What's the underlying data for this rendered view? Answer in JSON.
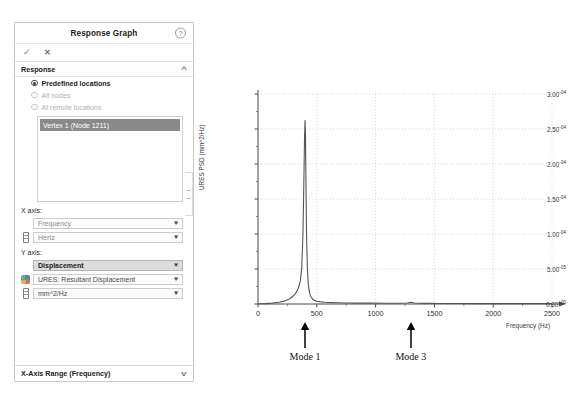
{
  "panel": {
    "title": "Response Graph",
    "help_icon": "?",
    "accept_icon": "check-icon",
    "cancel_icon": "close-icon",
    "sections": [
      {
        "title": "Response",
        "chevron": "^"
      }
    ],
    "radios": [
      {
        "label": "Predefined locations",
        "selected": true,
        "enabled": true
      },
      {
        "label": "All nodes",
        "selected": false,
        "enabled": false
      },
      {
        "label": "At remote locations",
        "selected": false,
        "enabled": false
      }
    ],
    "location_list": {
      "selected_item": "Vertex 1 (Node 1211)"
    },
    "x_axis": {
      "label": "X axis:",
      "quantity": "Frequency",
      "unit": "Hertz"
    },
    "y_axis": {
      "label": "Y axis:",
      "quantity": "Displacement",
      "component": "URES:   Resultant Displacement",
      "unit": "mm^2/Hz"
    },
    "bottom_section": {
      "title": "X-Axis Range  (Frequency)",
      "chevron": "v"
    }
  },
  "chart_data": {
    "type": "line",
    "title": "",
    "xlabel": "Frequency (Hz)",
    "ylabel": "URES PSD (mm^2/Hz)",
    "xlim": [
      0,
      2500
    ],
    "ylim": [
      0,
      0.0003
    ],
    "grid": true,
    "legend": null,
    "xticks": [
      0,
      500,
      1000,
      1500,
      2000,
      2500
    ],
    "xtick_labels": [
      "0",
      "500",
      "1000",
      "1500",
      "2000",
      "2500"
    ],
    "yticks": [
      0,
      5e-05,
      0.0001,
      0.00015,
      0.0002,
      0.00025,
      0.0003
    ],
    "ytick_labels": [
      {
        "mantissa": "0.00",
        "exponent": "+00"
      },
      {
        "mantissa": "5.00",
        "exponent": "-05"
      },
      {
        "mantissa": "1.00",
        "exponent": "-04"
      },
      {
        "mantissa": "1.50",
        "exponent": "-04"
      },
      {
        "mantissa": "2.00",
        "exponent": "-04"
      },
      {
        "mantissa": "2.50",
        "exponent": "-04"
      },
      {
        "mantissa": "3.00",
        "exponent": "-04"
      }
    ],
    "series": [
      {
        "name": "URES PSD",
        "color": "#555555",
        "x": [
          0,
          60,
          120,
          180,
          230,
          270,
          300,
          325,
          345,
          360,
          372,
          382,
          390,
          396,
          400,
          404,
          408,
          413,
          420,
          428,
          437,
          448,
          462,
          480,
          500,
          530,
          570,
          620,
          680,
          750,
          840,
          950,
          1080,
          1200,
          1270,
          1300,
          1330,
          1380,
          1450,
          1550,
          1700,
          1850,
          2000,
          2200,
          2400,
          2500
        ],
        "y": [
          4e-07,
          6e-07,
          1.2e-06,
          2.5e-06,
          4.5e-06,
          7.5e-06,
          1.15e-05,
          1.65e-05,
          2.35e-05,
          3.3e-05,
          5.2e-05,
          9.8e-05,
          0.000175,
          0.00024,
          0.000262,
          0.000238,
          0.00017,
          9.8e-05,
          5e-05,
          2.8e-05,
          1.7e-05,
          1.1e-05,
          7.5e-06,
          5.2e-06,
          4e-06,
          3e-06,
          2.4e-06,
          2e-06,
          1.7e-06,
          1.5e-06,
          1.3e-06,
          1.2e-06,
          1.1e-06,
          1.1e-06,
          1.4e-06,
          2.6e-06,
          1.5e-06,
          1.1e-06,
          9e-07,
          8e-07,
          7e-07,
          6e-07,
          6e-07,
          5e-07,
          5e-07,
          5e-07
        ]
      }
    ],
    "annotations": [
      {
        "label": "Mode 1",
        "x": 400,
        "marker": "up-arrow"
      },
      {
        "label": "Mode 3",
        "x": 1300,
        "marker": "up-arrow"
      }
    ]
  }
}
